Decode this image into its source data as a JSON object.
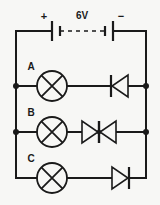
{
  "diagram": {
    "background_color": "#f7f7f5",
    "line_color": "#1a1a1a"
  },
  "source": {
    "voltage_label": "6V",
    "positive_label": "+",
    "negative_label": "−",
    "component": "battery-two-cells"
  },
  "branches": [
    {
      "label": "A",
      "lamp": "lamp-a",
      "diodes": [
        {
          "name": "diode-a1",
          "direction": "left"
        }
      ]
    },
    {
      "label": "B",
      "lamp": "lamp-b",
      "diodes": [
        {
          "name": "diode-b1",
          "direction": "right"
        },
        {
          "name": "diode-b2",
          "direction": "left"
        }
      ]
    },
    {
      "label": "C",
      "lamp": "lamp-c",
      "diodes": [
        {
          "name": "diode-c1",
          "direction": "right"
        }
      ]
    }
  ]
}
